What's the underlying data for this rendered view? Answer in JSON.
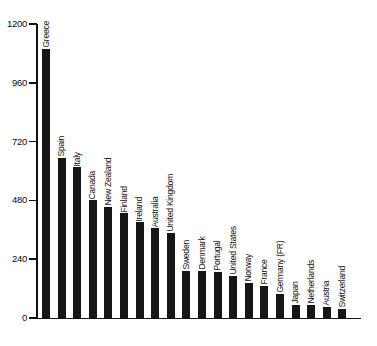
{
  "chart_data": {
    "type": "bar",
    "title": "",
    "subtitle": "",
    "xlabel": "",
    "ylabel": "",
    "ylim": [
      0,
      1200
    ],
    "yticks": [
      0,
      240,
      480,
      720,
      960,
      1200
    ],
    "grid": false,
    "legend": null,
    "orientation": "vertical",
    "bar_color": "#161616",
    "categories": [
      "Greece",
      "Spain",
      "Italy",
      "Canada",
      "New Zealand",
      "Finland",
      "Ireland",
      "Australia",
      "United Kingdom",
      "Sweden",
      "Denmark",
      "Portugal",
      "United States",
      "Norway",
      "France",
      "Germany (FR)",
      "Japan",
      "Netherlands",
      "Austria",
      "Switzerland"
    ],
    "values": [
      1100,
      655,
      615,
      480,
      455,
      428,
      390,
      367,
      347,
      193,
      192,
      188,
      172,
      143,
      131,
      98,
      54,
      53,
      45,
      37
    ]
  },
  "axes": {
    "y_tick_labels": [
      "1200",
      "960",
      "720",
      "480",
      "240",
      "0"
    ]
  },
  "colors": {
    "bar": "#161616",
    "axis": "#111111",
    "text": "#0d0d0d",
    "background": "#ffffff"
  }
}
